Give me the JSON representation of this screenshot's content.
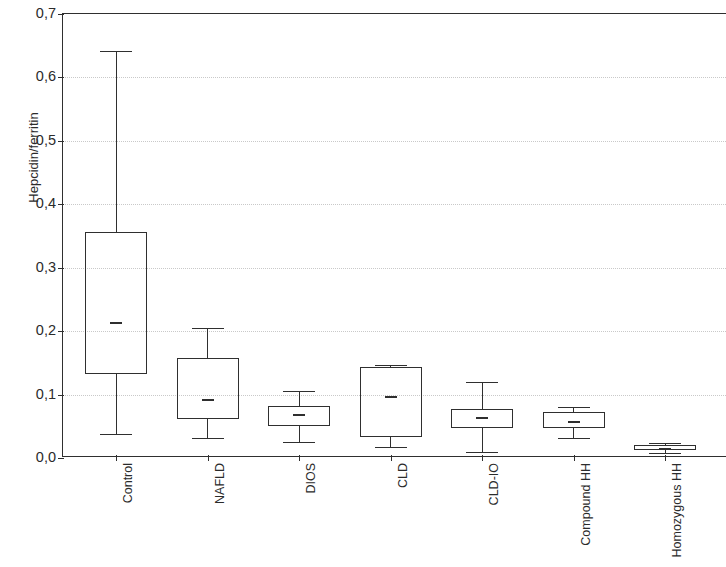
{
  "chart_data": {
    "type": "box",
    "title": "",
    "xlabel": "",
    "ylabel": "Hepcidin/ferritin",
    "ylim": [
      0.0,
      0.7
    ],
    "ytick_labels": [
      "0,7",
      "0,6",
      "0,5",
      "0,4",
      "0,3",
      "0,2",
      "0,1",
      "0,0"
    ],
    "ytick_values": [
      0.7,
      0.6,
      0.5,
      0.4,
      0.3,
      0.2,
      0.1,
      0.0
    ],
    "grid": true,
    "legend": "none",
    "decimal_separator": ",",
    "categories": [
      "Control",
      "NAFLD",
      "DIOS",
      "CLD",
      "CLD-IO",
      "Compound HH",
      "Homozygous HH"
    ],
    "boxes": [
      {
        "label": "Control",
        "whisker_low": 0.038,
        "q1": 0.133,
        "median": 0.215,
        "q3": 0.357,
        "whisker_high": 0.641
      },
      {
        "label": "NAFLD",
        "whisker_low": 0.032,
        "q1": 0.062,
        "median": 0.093,
        "q3": 0.157,
        "whisker_high": 0.205
      },
      {
        "label": "DIOS",
        "whisker_low": 0.025,
        "q1": 0.05,
        "median": 0.069,
        "q3": 0.082,
        "whisker_high": 0.105
      },
      {
        "label": "CLD",
        "whisker_low": 0.018,
        "q1": 0.033,
        "median": 0.097,
        "q3": 0.143,
        "whisker_high": 0.146
      },
      {
        "label": "CLD-IO",
        "whisker_low": 0.01,
        "q1": 0.047,
        "median": 0.064,
        "q3": 0.078,
        "whisker_high": 0.12
      },
      {
        "label": "Compound HH",
        "whisker_low": 0.032,
        "q1": 0.048,
        "median": 0.059,
        "q3": 0.072,
        "whisker_high": 0.08
      },
      {
        "label": "Homozygous HH",
        "whisker_low": 0.008,
        "q1": 0.012,
        "median": 0.016,
        "q3": 0.021,
        "whisker_high": 0.024
      }
    ],
    "colors": {
      "line": "#2f2f2f",
      "grid": "#c9c9c9",
      "background": "#ffffff",
      "text": "#2b2b2b"
    }
  }
}
